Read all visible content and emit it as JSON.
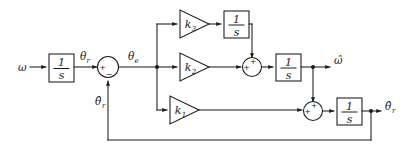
{
  "diagram": {
    "colors": {
      "line": "#1a1a1a",
      "background": "#ffffff",
      "block_fill": "#ffffff"
    },
    "input": {
      "label": "ω"
    },
    "outputs": {
      "omega_hat": "ω̂",
      "theta_r_hat": "θ̂",
      "theta_r_hat_sub": "r"
    },
    "signals": {
      "theta_r": "θ",
      "theta_r_sub": "r",
      "theta_e": "θ",
      "theta_e_sub": "e",
      "feedback": "θ̂",
      "feedback_sub": "r"
    },
    "integrators": [
      {
        "name": "input-integrator",
        "numerator": "1",
        "denominator": "s"
      },
      {
        "name": "top-integrator",
        "numerator": "1",
        "denominator": "s"
      },
      {
        "name": "middle-integrator",
        "numerator": "1",
        "denominator": "s"
      },
      {
        "name": "bottom-integrator",
        "numerator": "1",
        "denominator": "s"
      }
    ],
    "gains": [
      {
        "name": "gain-k3",
        "label": "k",
        "subscript": "3"
      },
      {
        "name": "gain-k2",
        "label": "k",
        "subscript": "2"
      },
      {
        "name": "gain-k1",
        "label": "k",
        "subscript": "1"
      }
    ],
    "summing_junctions": [
      {
        "name": "error-summing-junction",
        "signs": {
          "left": "+",
          "bottom": "−"
        }
      },
      {
        "name": "omega-summing-junction",
        "signs": {
          "left": "+",
          "top": "+"
        }
      },
      {
        "name": "theta-summing-junction",
        "signs": {
          "left": "+",
          "top": "+"
        }
      }
    ]
  }
}
